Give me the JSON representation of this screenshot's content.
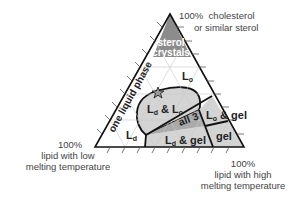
{
  "diagram": {
    "type": "ternary phase diagram",
    "vertices": {
      "top": {
        "percent": "100%",
        "line1": "cholesterol",
        "line2": "or similar sterol"
      },
      "bottom_left": {
        "percent": "100%",
        "line1": "lipid with low",
        "line2": "melting temperature"
      },
      "bottom_right": {
        "percent": "100%",
        "line1": "lipid with high",
        "line2": "melting temperature"
      }
    },
    "regions": {
      "sterol_line1": "sterol",
      "sterol_line2": "crystals",
      "lo_main": "L",
      "lo_sub": "o",
      "ld_main": "L",
      "ld_sub": "d",
      "one_liquid": "one liquid phase",
      "ldlo_a": "L",
      "ldlo_a_sub": "d",
      "ldlo_mid": " & L",
      "ldlo_b_sub": "o",
      "all3": "all 3",
      "logel_main": "L",
      "logel_sub": "o",
      "logel_rest": " & gel",
      "ldgel_main": "L",
      "ldgel_sub": "d",
      "ldgel_rest": " & gel",
      "gel": "gel"
    },
    "marker": "star",
    "colors": {
      "sterol_fill": "#8c8c8c",
      "two_phase_fill": "#d4d4d4",
      "three_phase_fill": "#aaaaaa",
      "grid": "#c8c8c8",
      "outline": "#111111"
    }
  }
}
